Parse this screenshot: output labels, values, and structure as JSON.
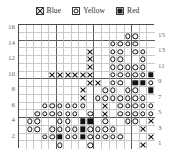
{
  "legend": {
    "items": [
      {
        "symbol": "x",
        "symbol_name": "x-swatch-icon",
        "label": "Blue",
        "color": "#0000cc"
      },
      {
        "symbol": "circle",
        "symbol_name": "circle-swatch-icon",
        "label": "Yellow",
        "color": "#ffcc00"
      },
      {
        "symbol": "filled",
        "symbol_name": "filled-swatch-icon",
        "label": "Red",
        "color": "#cc0000"
      }
    ]
  },
  "chart_data": {
    "type": "heatmap",
    "title": "",
    "xlabel": "",
    "ylabel": "",
    "grid": true,
    "legend_position": "top",
    "columns": 18,
    "rows": 16,
    "major_gridline_every": 5,
    "symbols": {
      "x": "Blue",
      "o": "Yellow",
      "f": "Red",
      ".": "empty"
    },
    "left_axis_ticks": [
      16,
      14,
      12,
      10,
      8,
      6,
      4,
      2
    ],
    "right_axis_ticks": [
      15,
      13,
      11,
      9,
      7,
      5,
      3,
      1
    ],
    "row_labels_top_to_bottom": [
      16,
      15,
      14,
      13,
      12,
      11,
      10,
      9,
      8,
      7,
      6,
      5,
      4,
      3,
      2,
      1
    ],
    "cells": [
      "..................",
      "..............oo..",
      "............oooo..",
      ".........x..oo.oo.",
      ".........x..oo..o.",
      ".........x..ooooo.",
      "....xxxxxx..ooooof",
      ".........xx.oo.ffo",
      "........x..oo.oo.f",
      "........x.ooooooo.",
      "...oooooo..x.ooooo",
      "..oooooo.o.x.ooooo",
      ".oo..oo.ff.o..oo.x",
      ".oo.oooofoooo...x.",
      "...oofoofooooo...x",
      ".....o...o......x."
    ]
  }
}
